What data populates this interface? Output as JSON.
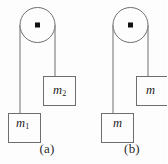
{
  "figure": {
    "type": "physics-diagram",
    "background_color": "#fdfdfd",
    "stroke_color": "#6e6e6e",
    "text_color": "#1a1a1a"
  },
  "panels": [
    {
      "caption": "(a)",
      "pulley": {
        "center_x": 37,
        "center_y": 25,
        "radius": 17
      },
      "left_rope": {
        "x": 20,
        "from_y": 25,
        "to_y": 113
      },
      "right_rope": {
        "x": 55,
        "from_y": 25,
        "to_y": 76
      },
      "masses": [
        {
          "label": "m",
          "subscript": "1",
          "x": 8,
          "y": 113,
          "width": 32,
          "height": 30
        },
        {
          "label": "m",
          "subscript": "2",
          "x": 43,
          "y": 76,
          "width": 32,
          "height": 30
        }
      ]
    },
    {
      "caption": "(b)",
      "pulley": {
        "center_x": 130,
        "center_y": 25,
        "radius": 17
      },
      "left_rope": {
        "x": 113,
        "from_y": 25,
        "to_y": 113
      },
      "right_rope": {
        "x": 148,
        "from_y": 25,
        "to_y": 76
      },
      "masses": [
        {
          "label": "m",
          "subscript": "",
          "x": 101,
          "y": 113,
          "width": 32,
          "height": 30
        },
        {
          "label": "m",
          "subscript": "",
          "x": 136,
          "y": 76,
          "width": 32,
          "height": 30
        }
      ]
    }
  ],
  "labels": {
    "caption_a": "(a)",
    "caption_b": "(b)",
    "mass_a_lower": "m",
    "mass_a_lower_sub": "1",
    "mass_a_upper": "m",
    "mass_a_upper_sub": "2",
    "mass_b_upper": "m",
    "mass_b_lower": "m"
  }
}
